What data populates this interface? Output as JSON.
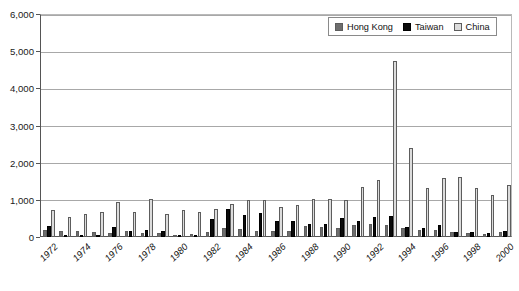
{
  "legend": {
    "position": "top-right",
    "entries": [
      {
        "label": "Hong Kong",
        "key": "hk",
        "color": "#6e6e6e",
        "icon": "legend-swatch-icon"
      },
      {
        "label": "Taiwan",
        "key": "tw",
        "color": "#0b0b0b",
        "icon": "legend-swatch-icon"
      },
      {
        "label": "China",
        "key": "cn",
        "color": "#dcdcdc",
        "icon": "legend-swatch-icon"
      }
    ]
  },
  "axis": {
    "y_ticks": [
      "0",
      "1,000",
      "2,000",
      "3,000",
      "4,000",
      "5,000",
      "6,000"
    ],
    "x_tick_labels": [
      "1972",
      "1974",
      "1976",
      "1978",
      "1980",
      "1982",
      "1984",
      "1986",
      "1988",
      "1990",
      "1992",
      "1994",
      "1996",
      "1998",
      "2000"
    ]
  },
  "chart_data": {
    "type": "bar",
    "title": "",
    "subtitle": "",
    "xlabel": "",
    "ylabel": "",
    "ylim": [
      0,
      6000
    ],
    "ytick_step": 1000,
    "grid": true,
    "legend_position": "top-right",
    "categories": [
      "1972",
      "1973",
      "1974",
      "1975",
      "1976",
      "1977",
      "1978",
      "1979",
      "1980",
      "1981",
      "1982",
      "1983",
      "1984",
      "1985",
      "1986",
      "1987",
      "1988",
      "1989",
      "1990",
      "1991",
      "1992",
      "1993",
      "1994",
      "1995",
      "1996",
      "1997",
      "1998",
      "1999",
      "2000"
    ],
    "tick_labelled_categories": [
      "1972",
      "1974",
      "1976",
      "1978",
      "1980",
      "1982",
      "1984",
      "1986",
      "1988",
      "1990",
      "1992",
      "1994",
      "1996",
      "1998",
      "2000"
    ],
    "series": [
      {
        "name": "Hong Kong",
        "color": "#6e6e6e",
        "values": [
          200,
          150,
          160,
          140,
          120,
          170,
          100,
          110,
          20,
          70,
          130,
          230,
          215,
          155,
          150,
          170,
          290,
          280,
          230,
          330,
          360,
          320,
          250,
          180,
          200,
          130,
          120,
          90,
          145
        ]
      },
      {
        "name": "Taiwan",
        "color": "#0b0b0b",
        "values": [
          300,
          20,
          30,
          30,
          275,
          170,
          195,
          165,
          25,
          30,
          480,
          745,
          580,
          650,
          430,
          420,
          340,
          360,
          500,
          420,
          530,
          560,
          280,
          235,
          310,
          130,
          130,
          110,
          155
        ]
      },
      {
        "name": "China",
        "color": "#dcdcdc",
        "values": [
          730,
          545,
          615,
          680,
          955,
          685,
          1025,
          630,
          720,
          680,
          760,
          900,
          990,
          985,
          805,
          850,
          1035,
          1020,
          1000,
          1335,
          1530,
          4740,
          2400,
          1330,
          1600,
          1620,
          1310,
          1140,
          1400
        ]
      }
    ]
  }
}
